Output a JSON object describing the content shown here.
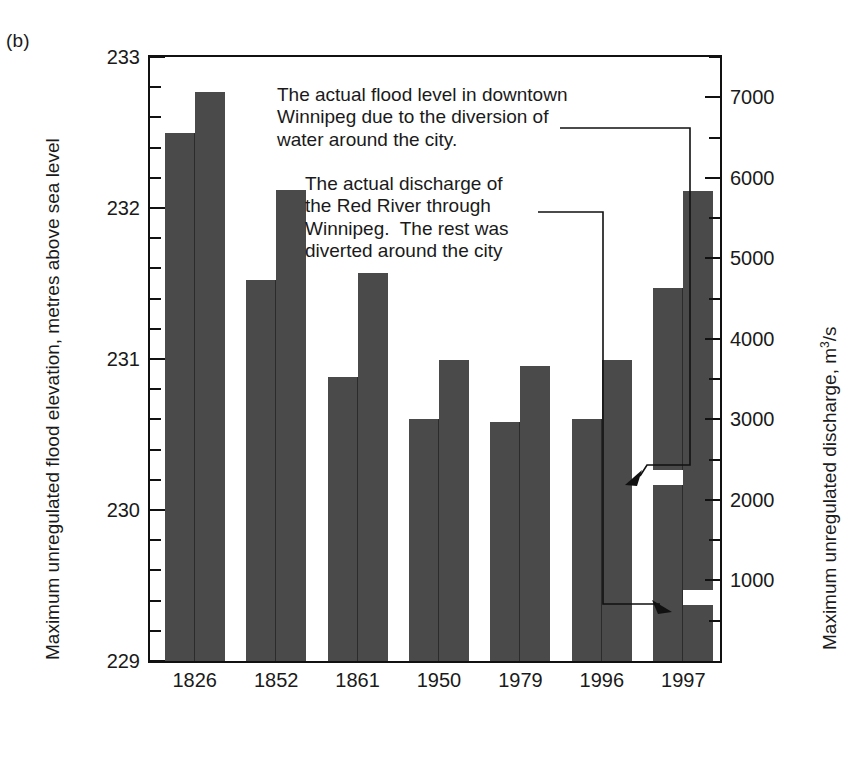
{
  "panel": {
    "label": "(b)"
  },
  "axes": {
    "y_left": {
      "title": "Maximum unregulated flood elevation, metres above sea level",
      "ticks": [
        229,
        230,
        231,
        232,
        233
      ],
      "min": 229,
      "max": 233,
      "minor_step": 0.2
    },
    "y_right": {
      "title_pre": "Maximum unregulated discharge, m",
      "title_sup": "3",
      "title_post": "/s",
      "ticks": [
        1000,
        2000,
        3000,
        4000,
        5000,
        6000,
        7000
      ],
      "min": 0,
      "max": 7500,
      "minor_step": 500
    },
    "x": {
      "categories": [
        "1826",
        "1852",
        "1861",
        "1950",
        "1979",
        "1996",
        "1997"
      ]
    }
  },
  "annotations": [
    {
      "id": "flood-level-note",
      "text": "The actual flood level in downtown\nWinnipeg due to the diversion of\nwater around the city."
    },
    {
      "id": "discharge-note",
      "text": "The actual discharge of\nthe Red River through\nWinnipeg.  The rest was\ndiverted around the city"
    }
  ],
  "style": {
    "bar_color": "#4a4a4a",
    "axis_color": "#111111",
    "background": "#ffffff",
    "text_color": "#1a1a1a"
  },
  "chart_data": {
    "type": "bar",
    "title": "",
    "subtitle": "",
    "xlabel": "",
    "ylabel": "Maximum unregulated flood elevation, metres above sea level",
    "y2label": "Maximum unregulated discharge, m3/s",
    "ylim": [
      229,
      233
    ],
    "y2lim": [
      0,
      7500
    ],
    "grid": false,
    "legend": "none",
    "categories": [
      "1826",
      "1852",
      "1861",
      "1950",
      "1979",
      "1996",
      "1997"
    ],
    "series": [
      {
        "name": "Maximum unregulated flood elevation (m above sea level)",
        "axis": "left",
        "units": "m",
        "values": [
          232.5,
          231.52,
          230.88,
          230.6,
          230.58,
          230.6,
          231.47
        ]
      },
      {
        "name": "Maximum unregulated discharge (m3/s)",
        "axis": "right",
        "units": "m3/s",
        "values": [
          7060,
          5850,
          4820,
          3740,
          3660,
          3740,
          5840
        ]
      }
    ],
    "marked_values": [
      {
        "category": "1997",
        "series": "Maximum unregulated flood elevation (m above sea level)",
        "label": "actual flood level in downtown Winnipeg after diversion",
        "value": 230.22
      },
      {
        "category": "1997",
        "series": "Maximum unregulated discharge (m3/s)",
        "label": "actual discharge of the Red River through Winnipeg",
        "value": 800
      }
    ]
  }
}
